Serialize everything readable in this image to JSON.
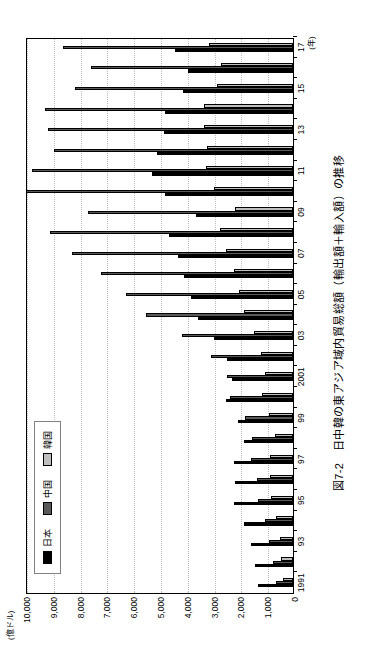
{
  "figure": {
    "title": "図7-2　日中韓の東アジア域内貿易総額（輸出額＋輸入額）の推移",
    "unit_label": "(億ドル)",
    "x_axis_unit": "(年)"
  },
  "legend": {
    "items": [
      {
        "label": "日本",
        "color": "#000000",
        "swatch": "sw-jp"
      },
      {
        "label": "中国",
        "color": "#595959",
        "swatch": "sw-cn"
      },
      {
        "label": "韓国",
        "color": "#bfbfbf",
        "swatch": "sw-kr"
      }
    ]
  },
  "chart_data": {
    "type": "bar",
    "title": "図7-2　日中韓の東アジア域内貿易総額（輸出額＋輸入額）の推移",
    "xlabel": "(年)",
    "ylabel": "(億ドル)",
    "ylim": [
      0,
      10000
    ],
    "ytick_labels": [
      "0",
      "1,000",
      "2,000",
      "3,000",
      "4,000",
      "5,000",
      "6,000",
      "7,000",
      "8,000",
      "9,000",
      "10,000"
    ],
    "ytick_values": [
      0,
      1000,
      2000,
      3000,
      4000,
      5000,
      6000,
      7000,
      8000,
      9000,
      10000
    ],
    "grid": true,
    "legend_position": "inside-left",
    "categories": [
      1991,
      1992,
      1993,
      1994,
      1995,
      1996,
      1997,
      1998,
      1999,
      2000,
      2001,
      2002,
      2003,
      2004,
      2005,
      2006,
      2007,
      2008,
      2009,
      2010,
      2011,
      2012,
      2013,
      2014,
      2015,
      2016,
      2017
    ],
    "xtick_labels": [
      "1991",
      "",
      "93",
      "",
      "95",
      "",
      "97",
      "",
      "99",
      "",
      "2001",
      "",
      "03",
      "",
      "05",
      "",
      "07",
      "",
      "09",
      "",
      "11",
      "",
      "13",
      "",
      "15",
      "",
      "17"
    ],
    "series": [
      {
        "name": "日本",
        "color": "#000000",
        "values": [
          1310,
          1400,
          1560,
          1830,
          2200,
          2180,
          2200,
          1820,
          2050,
          2500,
          2280,
          2480,
          2960,
          3540,
          3800,
          4060,
          4300,
          4630,
          3620,
          4790,
          5280,
          5080,
          4820,
          4760,
          4100,
          3920,
          4420
        ]
      },
      {
        "name": "中国",
        "color": "#595959",
        "values": [
          620,
          730,
          890,
          1050,
          1300,
          1330,
          1580,
          1520,
          1780,
          2360,
          2480,
          3060,
          4160,
          5500,
          6240,
          7180,
          8240,
          9060,
          7650,
          9960,
          9750,
          8900,
          9140,
          9260,
          8130,
          7530,
          8570
        ]
      },
      {
        "name": "韓国",
        "color": "#bfbfbf",
        "values": [
          380,
          430,
          500,
          620,
          820,
          860,
          860,
          680,
          890,
          1150,
          1040,
          1180,
          1450,
          1830,
          2000,
          2220,
          2500,
          2740,
          2180,
          2930,
          3260,
          3220,
          3330,
          3310,
          2840,
          2700,
          3130
        ]
      }
    ]
  }
}
